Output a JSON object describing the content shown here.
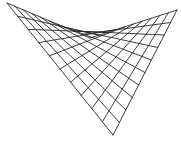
{
  "diagram": {
    "title": "",
    "type": "hyperbolic-paraboloid-wireframe",
    "stroke_color": "#2a2a2a",
    "background": "#ffffff",
    "divisions": 10,
    "corners": {
      "left": [
        7,
        3
      ],
      "right": [
        177,
        10
      ],
      "front": [
        113,
        135
      ],
      "back": [
        90,
        38
      ]
    }
  }
}
